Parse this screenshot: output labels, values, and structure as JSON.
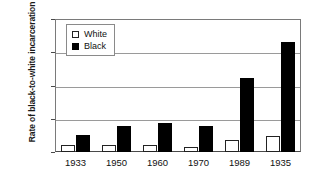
{
  "chart_data": {
    "type": "bar",
    "title": "",
    "subtitle": "",
    "xlabel": "",
    "ylabel": "Rate of black-to-white incarceration",
    "categories": [
      "1933",
      "1950",
      "1960",
      "1970",
      "1989",
      "1935"
    ],
    "series": [
      {
        "name": "White",
        "color": "#ffffff",
        "values": [
          0.11,
          0.11,
          0.11,
          0.08,
          0.18,
          0.24
        ]
      },
      {
        "name": "Black",
        "color": "#000000",
        "values": [
          0.26,
          0.39,
          0.44,
          0.39,
          1.11,
          1.66
        ]
      }
    ],
    "ylim": [
      0,
      2
    ],
    "yticks": [
      0,
      0.5,
      1,
      1.5,
      2
    ],
    "ytick_labels": [
      "0",
      "0.5",
      "1",
      "1.5",
      "2"
    ],
    "grid": "horizontal",
    "legend_position": "top-left"
  },
  "legend": {
    "entries": [
      {
        "label": "White",
        "swatch": "white-square-icon"
      },
      {
        "label": "Black",
        "swatch": "black-square-icon"
      }
    ]
  },
  "axis": {
    "y_title": "Rate of black-to-white incarceration"
  }
}
